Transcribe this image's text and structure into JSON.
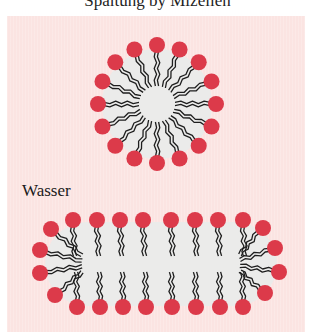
{
  "caption": "Spaltung by Mizellen",
  "labels": {
    "water": "Wasser"
  },
  "colors": {
    "background_panel": "#fbe4e2",
    "head": "#dc3a4a",
    "core": "#ebebea",
    "tail": "#1e1e1e"
  },
  "figures": {
    "micelle": {
      "shape": "spherical",
      "head_count": 16,
      "center": [
        157,
        104
      ],
      "head_ring_radius": 59
    },
    "rod_micelle": {
      "shape": "elongated",
      "top_row_heads": 9,
      "bottom_row_heads": 8,
      "side_heads_each": 4
    }
  }
}
